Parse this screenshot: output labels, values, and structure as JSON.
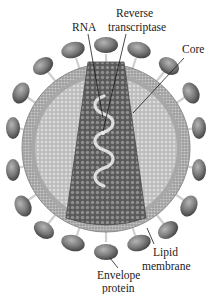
{
  "figure": {
    "labels": {
      "rna": "RNA",
      "reverse_transcriptase_line1": "Reverse",
      "reverse_transcriptase_line2": "transcriptase",
      "core": "Core",
      "lipid_membrane_line1": "Lipid",
      "lipid_membrane_line2": "membrane",
      "envelope_protein_line1": "Envelope",
      "envelope_protein_line2": "protein"
    },
    "colors": {
      "envelope_protein": "#6e6e6e",
      "membrane": "#a9a9a9",
      "interior": "#c4c4c4",
      "core": "#6a6a6a",
      "rna": "#d8d8d8",
      "text": "#1a1a1a"
    }
  }
}
